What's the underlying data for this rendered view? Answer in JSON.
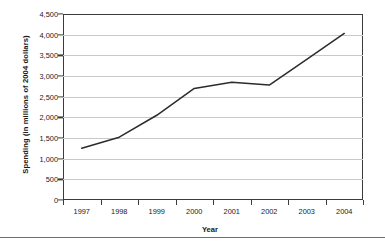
{
  "chart_data": {
    "type": "line",
    "title": "",
    "xlabel": "Year",
    "ylabel": "Spending (in millions of 2004 dollars)",
    "categories": [
      "1997",
      "1998",
      "1999",
      "2000",
      "2001",
      "2002",
      "2003",
      "2004"
    ],
    "values": [
      1250,
      1520,
      2050,
      2700,
      2850,
      2780,
      3400,
      4030
    ],
    "series": [
      {
        "name": "Spending",
        "values": [
          1250,
          1520,
          2050,
          2700,
          2850,
          2780,
          3400,
          4030
        ],
        "color": "#2b2b2b"
      }
    ],
    "ylim": [
      0,
      4500
    ],
    "ytick_values": [
      0,
      500,
      1000,
      1500,
      2000,
      2500,
      3000,
      3500,
      4000,
      4500
    ],
    "ytick_labels": [
      "0",
      "500",
      "1,000",
      "1,500",
      "2,000",
      "2,500",
      "3,000",
      "3,500",
      "4,000",
      "4,500"
    ],
    "xtick_labels": [
      "1997",
      "1998",
      "1999",
      "2000",
      "2001",
      "2002",
      "2003",
      "2004"
    ],
    "grid": true,
    "grid_axis": "y",
    "legend": false,
    "legend_position": "none",
    "markers": false,
    "line_color": "#2b2b2b",
    "grid_color": "#c9c9c9",
    "axis_color": "#3b3b3b",
    "background": "#ffffff"
  }
}
